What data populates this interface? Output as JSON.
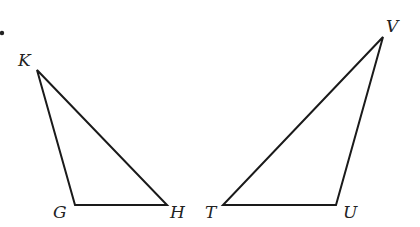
{
  "diagram": {
    "marker_dot": {
      "x": 2,
      "y": 33
    },
    "triangles": [
      {
        "name": "KGH",
        "vertices": [
          {
            "label": "K",
            "x": 37,
            "y": 70,
            "lx": 18,
            "ly": 66
          },
          {
            "label": "G",
            "x": 75,
            "y": 205,
            "lx": 53,
            "ly": 218
          },
          {
            "label": "H",
            "x": 167,
            "y": 205,
            "lx": 170,
            "ly": 218
          }
        ]
      },
      {
        "name": "TUV",
        "vertices": [
          {
            "label": "T",
            "x": 223,
            "y": 205,
            "lx": 205,
            "ly": 218
          },
          {
            "label": "U",
            "x": 336,
            "y": 205,
            "lx": 343,
            "ly": 218
          },
          {
            "label": "V",
            "x": 383,
            "y": 37,
            "lx": 386,
            "ly": 32
          }
        ]
      }
    ]
  }
}
